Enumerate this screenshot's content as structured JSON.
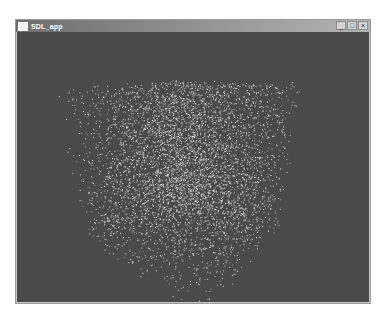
{
  "window": {
    "title": "SDL_app",
    "controls": {
      "minimize": "_",
      "maximize": "□",
      "close": "×"
    }
  },
  "canvas": {
    "background": "#4a4a4a",
    "point_color": "#dcdcdc",
    "content": "random point cloud forming a rotated cube"
  }
}
